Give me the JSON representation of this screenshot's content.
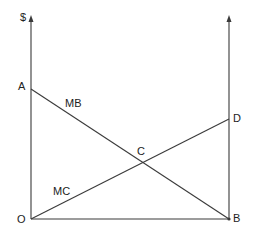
{
  "diagram": {
    "type": "economics-marginal-benefit-cost",
    "colors": {
      "line": "#3a3a3a",
      "text": "#222222",
      "background": "#ffffff"
    },
    "axis_label_y": "$",
    "points": {
      "A": {
        "label": "A",
        "x": 31,
        "y": 89
      },
      "O": {
        "label": "O",
        "x": 31,
        "y": 219
      },
      "B": {
        "label": "B",
        "x": 229,
        "y": 219
      },
      "D": {
        "label": "D",
        "x": 229,
        "y": 119
      },
      "C": {
        "label": "C",
        "x": 144,
        "y": 163
      }
    },
    "curves": {
      "mb": {
        "label": "MB",
        "from": "A",
        "to": "B"
      },
      "mc": {
        "label": "MC",
        "from": "O",
        "to": "D"
      }
    }
  }
}
